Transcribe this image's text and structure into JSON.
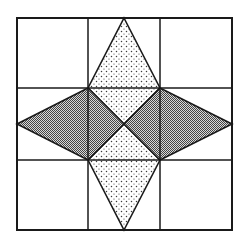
{
  "diagram": {
    "type": "geometric-tiling",
    "colors": {
      "background": "#ffffff",
      "stroke": "#1a1a1a",
      "dot_fill": "#3a3a3a",
      "hatch_fill": "#555555"
    },
    "outer_square": {
      "x1": 17,
      "y1": 18,
      "x2": 232,
      "y2": 230
    },
    "grid": {
      "vertical_lines_x": [
        88,
        160
      ],
      "horizontal_lines_y": [
        88,
        160
      ]
    },
    "center": {
      "x": 124,
      "y": 124
    },
    "regions": [
      {
        "name": "top-dotted-kite",
        "pattern": "dots",
        "points": [
          [
            124,
            18
          ],
          [
            160,
            88
          ],
          [
            124,
            124
          ],
          [
            88,
            88
          ]
        ]
      },
      {
        "name": "bottom-dotted-kite",
        "pattern": "dots",
        "points": [
          [
            124,
            230
          ],
          [
            160,
            160
          ],
          [
            124,
            124
          ],
          [
            88,
            160
          ]
        ]
      },
      {
        "name": "left-hatched-kite",
        "pattern": "hatch",
        "points": [
          [
            17,
            124
          ],
          [
            88,
            88
          ],
          [
            124,
            124
          ],
          [
            88,
            160
          ]
        ]
      },
      {
        "name": "right-hatched-kite",
        "pattern": "hatch",
        "points": [
          [
            232,
            124
          ],
          [
            160,
            88
          ],
          [
            124,
            124
          ],
          [
            160,
            160
          ]
        ]
      }
    ]
  }
}
